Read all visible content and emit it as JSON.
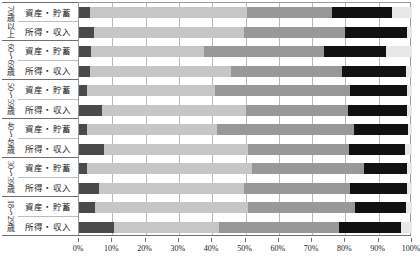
{
  "chart_data": {
    "type": "bar",
    "orientation": "horizontal",
    "stacked": true,
    "normalized": "100%",
    "title": "",
    "xlabel": "",
    "ylabel": "",
    "xlim": [
      0,
      100
    ],
    "grid": true,
    "legend_position": "none",
    "xtick_labels": [
      "0%",
      "10%",
      "20%",
      "30%",
      "40%",
      "50%",
      "60%",
      "70%",
      "80%",
      "90%",
      "100%"
    ],
    "xtick_values": [
      0,
      10,
      20,
      30,
      40,
      50,
      60,
      70,
      80,
      90,
      100
    ],
    "groups": [
      {
        "label": "70歳以上"
      },
      {
        "label": "60～69歳"
      },
      {
        "label": "50～59歳"
      },
      {
        "label": "40～49歳"
      },
      {
        "label": "30～39歳"
      },
      {
        "label": "18～29歳"
      }
    ],
    "categories": [
      "資産・貯蓄",
      "所得・収入",
      "資産・貯蓄",
      "所得・収入",
      "資産・貯蓄",
      "所得・収入",
      "資産・貯蓄",
      "所得・収入",
      "資産・貯蓄",
      "所得・収入",
      "資産・貯蓄",
      "所得・収入"
    ],
    "series": [
      {
        "name": "segment-1",
        "color": "#4a4a4a",
        "values": [
          3.3,
          4.5,
          3.6,
          3.3,
          2.5,
          6.9,
          2.3,
          7.6,
          2.3,
          6.0,
          4.9,
          10.5
        ]
      },
      {
        "name": "segment-2",
        "color": "#c6c6c6",
        "values": [
          47.1,
          45.1,
          33.9,
          42.3,
          38.3,
          43.2,
          39.0,
          43.3,
          49.7,
          43.5,
          46.0,
          31.5
        ]
      },
      {
        "name": "segment-3",
        "color": "#989898",
        "values": [
          25.5,
          30.3,
          36.0,
          33.3,
          40.5,
          30.6,
          41.4,
          30.2,
          33.5,
          32.0,
          32.0,
          36.0
        ]
      },
      {
        "name": "segment-4",
        "color": "#111111",
        "values": [
          18.0,
          18.6,
          18.6,
          19.2,
          17.1,
          17.7,
          16.2,
          16.7,
          13.1,
          17.0,
          15.3,
          18.6
        ]
      },
      {
        "name": "segment-5",
        "color": "#e8e8e8",
        "values": [
          6.1,
          1.5,
          7.9,
          1.9,
          1.6,
          1.6,
          1.1,
          2.2,
          1.4,
          1.5,
          1.8,
          3.4
        ]
      }
    ]
  }
}
